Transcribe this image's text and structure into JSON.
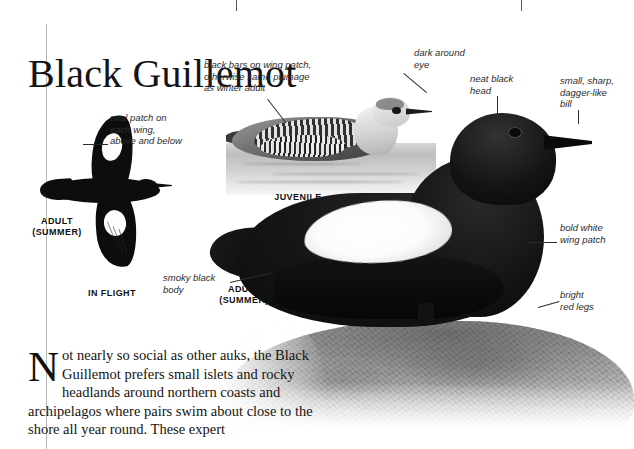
{
  "top_strip": {
    "cells": [
      "",
      "",
      ""
    ]
  },
  "page": {
    "title": "Black Guillemot",
    "figures": {
      "in_flight": {
        "caption_stage": "ADULT\n(SUMMER)",
        "caption_pose": "IN FLIGHT",
        "annotation": "oval patch on\neach wing,\nabove and below"
      },
      "juvenile": {
        "caption": "JUVENILE",
        "annotations": [
          "black bars on wing patch,\notherwise same plumage\nas winter adult",
          "dark around\neye"
        ]
      },
      "adult_summer": {
        "caption": "ADULT\n(SUMMER)",
        "annotations": [
          "neat black\nhead",
          "small, sharp,\ndagger-like\nbill",
          "bold white\nwing patch",
          "bright\nred legs",
          "smoky black\nbody"
        ]
      }
    },
    "body_text": {
      "dropcap": "N",
      "text": "ot nearly so social as other auks, the Black Guillemot prefers small islets and rocky headlands around northern coasts and archipelagos where pairs swim about close to the shore all year round. These expert"
    }
  },
  "colors": {
    "ink": "#141414",
    "rule": "#b9b9b9",
    "annotation": "#2c2c2c",
    "paper": "#ffffff"
  }
}
